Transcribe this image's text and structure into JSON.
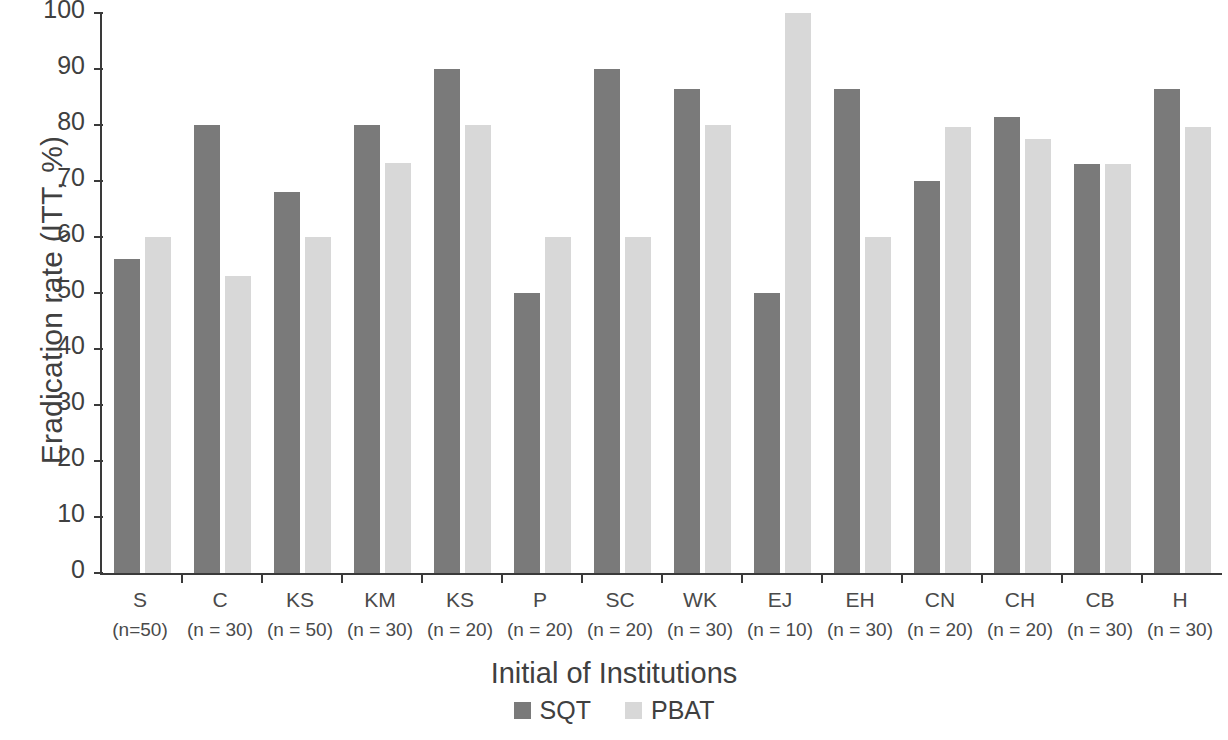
{
  "chart_data": {
    "type": "bar",
    "title": "",
    "xlabel": "Initial of Institutions",
    "ylabel": "Eradication rate (ITT, %)",
    "ylim": [
      0,
      100
    ],
    "yticks": [
      0,
      10,
      20,
      30,
      40,
      50,
      60,
      70,
      80,
      90,
      100
    ],
    "grid": false,
    "legend_position": "bottom-center",
    "categories": [
      "S",
      "C",
      "KS",
      "KM",
      "KS",
      "P",
      "SC",
      "WK",
      "EJ",
      "EH",
      "CN",
      "CH",
      "CB",
      "H"
    ],
    "category_sublabels": [
      "(n=50)",
      "(n = 30)",
      "(n = 50)",
      "(n = 30)",
      "(n = 20)",
      "(n = 20)",
      "(n = 20)",
      "(n = 30)",
      "(n = 10)",
      "(n = 30)",
      "(n = 20)",
      "(n = 20)",
      "(n = 30)",
      "(n = 30)"
    ],
    "series": [
      {
        "name": "SQT",
        "color": "#7a7a7a",
        "values": [
          56,
          80,
          68,
          80,
          90,
          50,
          90,
          86.5,
          50,
          86.5,
          70,
          81.5,
          73,
          86.5
        ]
      },
      {
        "name": "PBAT",
        "color": "#d8d8d8",
        "values": [
          60,
          53,
          60,
          73.3,
          80,
          60,
          60,
          80,
          100,
          60,
          79.7,
          77.5,
          73,
          79.7
        ]
      }
    ]
  },
  "legend": {
    "items": [
      {
        "label": "SQT",
        "color": "#7a7a7a"
      },
      {
        "label": "PBAT",
        "color": "#d8d8d8"
      }
    ]
  },
  "axes": {
    "y_title": "Eradication rate (ITT, %)",
    "x_title": "Initial of Institutions",
    "y_tick_labels": [
      "100",
      "90",
      "80",
      "70",
      "60",
      "50",
      "40",
      "30",
      "20",
      "10",
      "0"
    ]
  },
  "colors": {
    "sqt": "#7a7a7a",
    "pbat": "#d8d8d8",
    "axis": "#3a3a3a",
    "text": "#404040",
    "background": "#ffffff"
  }
}
